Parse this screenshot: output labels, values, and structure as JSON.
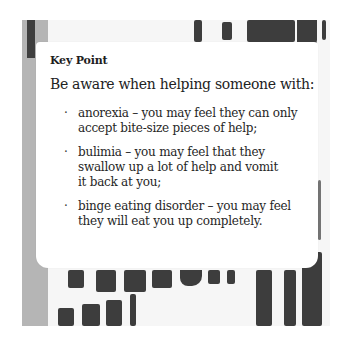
{
  "card": {
    "title": "Key Point",
    "intro": "Be aware when helping someone with:",
    "bullet_symbol": "·",
    "bullets": [
      {
        "line1": "anorexia – you may feel they can only",
        "line2": "accept bite-size pieces of help;",
        "line3": ""
      },
      {
        "line1": "bulimia – you may feel that they",
        "line2": "swallow up a lot of help and vomit",
        "line3": "it back at you;"
      },
      {
        "line1": "binge eating disorder – you may feel",
        "line2": "they will eat you up completely.",
        "line3": ""
      }
    ]
  },
  "background": {
    "frame_color": "#f6f6f6",
    "stripe_color": "#b5b5b5",
    "paint_color": "#3d3d3d",
    "card_color": "#ffffff"
  }
}
